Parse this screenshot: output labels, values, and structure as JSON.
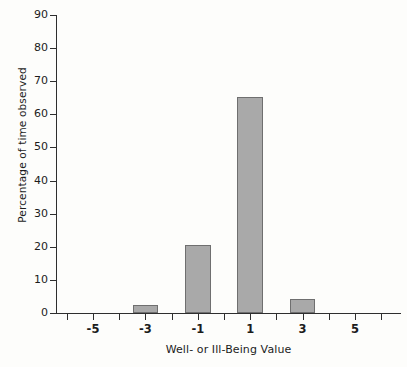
{
  "chart_data": {
    "type": "bar",
    "title": "",
    "subtitle": "",
    "xlabel": "Well- or Ill-Being Value",
    "ylabel": "Percentage of time observed",
    "categories": [
      "-5",
      "-4",
      "-3",
      "-2",
      "-1",
      "0",
      "1",
      "2",
      "3",
      "4",
      "5"
    ],
    "values": [
      0,
      0,
      2.3,
      0,
      20.4,
      0,
      65.3,
      0,
      4.3,
      0,
      0
    ],
    "series": [
      {
        "name": "Percentage of time observed",
        "values": [
          0,
          0,
          2.3,
          0,
          20.4,
          0,
          65.3,
          0,
          4.3,
          0,
          0
        ]
      }
    ],
    "labeled_bars": [
      {
        "x": "-3",
        "value": 2.3
      },
      {
        "x": "-1",
        "value": 20.4
      },
      {
        "x": "1",
        "value": 65.3
      },
      {
        "x": "3",
        "value": 4.3
      }
    ],
    "ylim": [
      0,
      90
    ],
    "yticks": [
      "0",
      "10",
      "20",
      "30",
      "40",
      "50",
      "60",
      "70",
      "80",
      "90"
    ],
    "xtick_labels": [
      "-5",
      "-3",
      "-1",
      "1",
      "3",
      "5"
    ],
    "grid": false,
    "legend": false,
    "legend_position": "none",
    "colors": {
      "bar_fill": "#a9a9a9",
      "bar_border": "#6f6f6f",
      "axis": "#2e2e2e",
      "text": "#1c1c1c",
      "background": "#fdfdfb"
    }
  },
  "axes": {
    "y": {
      "label": "Percentage of time observed",
      "ticks": [
        {
          "label": "90",
          "value": 90
        },
        {
          "label": "80",
          "value": 80
        },
        {
          "label": "70",
          "value": 70
        },
        {
          "label": "60",
          "value": 60
        },
        {
          "label": "50",
          "value": 50
        },
        {
          "label": "40",
          "value": 40
        },
        {
          "label": "30",
          "value": 30
        },
        {
          "label": "20",
          "value": 20
        },
        {
          "label": "10",
          "value": 10
        },
        {
          "label": "0",
          "value": 0
        }
      ]
    },
    "x": {
      "label": "Well- or Ill-Being Value",
      "ticks": [
        {
          "label": "-5",
          "value": -5
        },
        {
          "label": "-3",
          "value": -3
        },
        {
          "label": "-1",
          "value": -1
        },
        {
          "label": "1",
          "value": 1
        },
        {
          "label": "3",
          "value": 3
        },
        {
          "label": "5",
          "value": 5
        }
      ]
    }
  }
}
